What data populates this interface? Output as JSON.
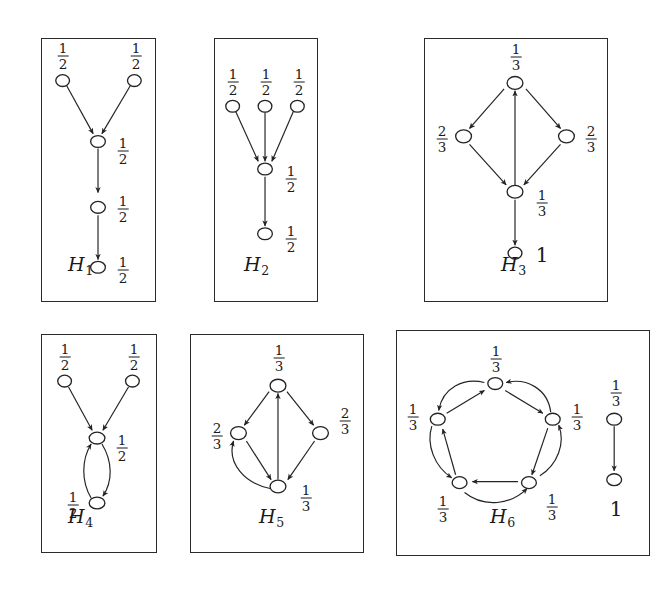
{
  "figure": {
    "background_color": "#ffffff",
    "stroke_color": "#242424",
    "node_fill": "#ffffff"
  },
  "labels": {
    "one_half": "1/2",
    "one_third": "1/3",
    "two_thirds": "2/3",
    "one": "1",
    "num_1": "1",
    "den_2": "2",
    "den_3": "3",
    "num_2": "2"
  },
  "panels": [
    {
      "id": "H1",
      "caption_letter": "H",
      "caption_sub": "1",
      "nodes": [
        {
          "name": "top-left",
          "label": "1/2",
          "label_pos": "above"
        },
        {
          "name": "top-right",
          "label": "1/2",
          "label_pos": "above"
        },
        {
          "name": "mid-upper",
          "label": "1/2",
          "label_pos": "right"
        },
        {
          "name": "mid-lower",
          "label": "1/2",
          "label_pos": "right"
        },
        {
          "name": "bottom",
          "label": "1/2",
          "label_pos": "right"
        }
      ],
      "edges": [
        {
          "from": "top-left",
          "to": "mid-upper",
          "style": "straight"
        },
        {
          "from": "top-right",
          "to": "mid-upper",
          "style": "straight"
        },
        {
          "from": "mid-upper",
          "to": "mid-lower",
          "style": "straight"
        },
        {
          "from": "mid-lower",
          "to": "bottom",
          "style": "straight"
        }
      ]
    },
    {
      "id": "H2",
      "caption_letter": "H",
      "caption_sub": "2",
      "nodes": [
        {
          "name": "top-left",
          "label": "1/2",
          "label_pos": "above"
        },
        {
          "name": "top-center",
          "label": "1/2",
          "label_pos": "above"
        },
        {
          "name": "top-right",
          "label": "1/2",
          "label_pos": "above"
        },
        {
          "name": "middle",
          "label": "1/2",
          "label_pos": "right"
        },
        {
          "name": "bottom",
          "label": "1/2",
          "label_pos": "right"
        }
      ],
      "edges": [
        {
          "from": "top-left",
          "to": "middle",
          "style": "straight"
        },
        {
          "from": "top-center",
          "to": "middle",
          "style": "straight"
        },
        {
          "from": "top-right",
          "to": "middle",
          "style": "straight"
        },
        {
          "from": "middle",
          "to": "bottom",
          "style": "straight"
        }
      ]
    },
    {
      "id": "H3",
      "caption_letter": "H",
      "caption_sub": "3",
      "nodes": [
        {
          "name": "top",
          "label": "1/3",
          "label_pos": "above"
        },
        {
          "name": "left",
          "label": "2/3",
          "label_pos": "left"
        },
        {
          "name": "right",
          "label": "2/3",
          "label_pos": "right"
        },
        {
          "name": "bottom",
          "label": "1/3",
          "label_pos": "right"
        },
        {
          "name": "sink",
          "label": "1",
          "label_pos": "right"
        }
      ],
      "edges": [
        {
          "from": "top",
          "to": "left",
          "style": "straight"
        },
        {
          "from": "top",
          "to": "right",
          "style": "straight"
        },
        {
          "from": "left",
          "to": "bottom",
          "style": "straight"
        },
        {
          "from": "right",
          "to": "bottom",
          "style": "straight"
        },
        {
          "from": "bottom",
          "to": "top",
          "style": "straight"
        },
        {
          "from": "bottom",
          "to": "sink",
          "style": "straight"
        }
      ]
    },
    {
      "id": "H4",
      "caption_letter": "H",
      "caption_sub": "4",
      "nodes": [
        {
          "name": "top-left",
          "label": "1/2",
          "label_pos": "above"
        },
        {
          "name": "top-right",
          "label": "1/2",
          "label_pos": "above"
        },
        {
          "name": "middle",
          "label": "1/2",
          "label_pos": "right"
        },
        {
          "name": "bottom",
          "label": "1/2",
          "label_pos": "left"
        }
      ],
      "edges": [
        {
          "from": "top-left",
          "to": "middle",
          "style": "straight"
        },
        {
          "from": "top-right",
          "to": "middle",
          "style": "straight"
        },
        {
          "from": "middle",
          "to": "bottom",
          "style": "curved-right"
        },
        {
          "from": "bottom",
          "to": "middle",
          "style": "curved-left"
        }
      ]
    },
    {
      "id": "H5",
      "caption_letter": "H",
      "caption_sub": "5",
      "nodes": [
        {
          "name": "top",
          "label": "1/3",
          "label_pos": "above"
        },
        {
          "name": "left",
          "label": "2/3",
          "label_pos": "left"
        },
        {
          "name": "right",
          "label": "2/3",
          "label_pos": "right"
        },
        {
          "name": "bottom",
          "label": "1/3",
          "label_pos": "right"
        }
      ],
      "edges": [
        {
          "from": "top",
          "to": "left",
          "style": "straight"
        },
        {
          "from": "top",
          "to": "right",
          "style": "straight"
        },
        {
          "from": "left",
          "to": "bottom",
          "style": "straight"
        },
        {
          "from": "right",
          "to": "bottom",
          "style": "straight"
        },
        {
          "from": "bottom",
          "to": "top",
          "style": "straight"
        },
        {
          "from": "bottom",
          "to": "left",
          "style": "curved"
        }
      ]
    },
    {
      "id": "H6",
      "caption_letter": "H",
      "caption_sub": "6",
      "nodes": [
        {
          "name": "ring-top",
          "label": "1/3",
          "label_pos": "above"
        },
        {
          "name": "ring-upper-left",
          "label": "1/3",
          "label_pos": "left"
        },
        {
          "name": "ring-upper-right",
          "label": "1/3",
          "label_pos": "right"
        },
        {
          "name": "ring-lower-left",
          "label": "1/3",
          "label_pos": "below-left"
        },
        {
          "name": "ring-lower-right",
          "label": "1/3",
          "label_pos": "below-right"
        },
        {
          "name": "side-top",
          "label": "1/3",
          "label_pos": "above"
        },
        {
          "name": "side-bottom",
          "label": "1",
          "label_pos": "below"
        }
      ],
      "edges": [
        {
          "from": "ring-top",
          "to": "ring-upper-right",
          "style": "straight"
        },
        {
          "from": "ring-upper-right",
          "to": "ring-top",
          "style": "curved"
        },
        {
          "from": "ring-upper-right",
          "to": "ring-lower-right",
          "style": "straight"
        },
        {
          "from": "ring-lower-right",
          "to": "ring-upper-right",
          "style": "curved"
        },
        {
          "from": "ring-lower-right",
          "to": "ring-lower-left",
          "style": "straight"
        },
        {
          "from": "ring-lower-left",
          "to": "ring-lower-right",
          "style": "curved"
        },
        {
          "from": "ring-lower-left",
          "to": "ring-upper-left",
          "style": "straight"
        },
        {
          "from": "ring-upper-left",
          "to": "ring-lower-left",
          "style": "curved"
        },
        {
          "from": "ring-upper-left",
          "to": "ring-top",
          "style": "straight"
        },
        {
          "from": "ring-top",
          "to": "ring-upper-left",
          "style": "curved"
        },
        {
          "from": "side-top",
          "to": "side-bottom",
          "style": "straight"
        }
      ]
    }
  ]
}
